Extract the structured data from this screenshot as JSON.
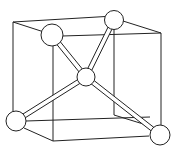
{
  "diagram": {
    "title": "",
    "colors": {
      "line": "#222222",
      "fill": "#ffffff",
      "background": "#ffffff"
    },
    "cube_edges": [
      {
        "x1": 13,
        "y1": 22,
        "x2": 114,
        "y2": 16
      },
      {
        "x1": 13,
        "y1": 22,
        "x2": 44,
        "y2": 32
      },
      {
        "x1": 123,
        "y1": 21,
        "x2": 161,
        "y2": 33
      },
      {
        "x1": 62,
        "y1": 36,
        "x2": 161,
        "y2": 33
      },
      {
        "x1": 13,
        "y1": 22,
        "x2": 13,
        "y2": 113
      },
      {
        "x1": 53,
        "y1": 46,
        "x2": 53,
        "y2": 141
      },
      {
        "x1": 161,
        "y1": 33,
        "x2": 161,
        "y2": 125
      },
      {
        "x1": 114,
        "y1": 29,
        "x2": 114,
        "y2": 115
      },
      {
        "x1": 26,
        "y1": 121,
        "x2": 150,
        "y2": 117
      },
      {
        "x1": 24,
        "y1": 128,
        "x2": 53,
        "y2": 141
      },
      {
        "x1": 53,
        "y1": 141,
        "x2": 149,
        "y2": 136
      },
      {
        "x1": 114,
        "y1": 115,
        "x2": 153,
        "y2": 127
      }
    ],
    "bonds": [
      {
        "from": "center",
        "to": "top-left"
      },
      {
        "from": "center",
        "to": "top-right"
      },
      {
        "from": "center",
        "to": "bottom-left"
      },
      {
        "from": "center",
        "to": "bottom-right"
      }
    ],
    "atoms": [
      {
        "id": "top-left",
        "cx": 52,
        "cy": 35,
        "r": 11
      },
      {
        "id": "top-right",
        "cx": 114,
        "cy": 20,
        "r": 9.5
      },
      {
        "id": "center",
        "cx": 86,
        "cy": 77,
        "r": 9
      },
      {
        "id": "bottom-left",
        "cx": 16,
        "cy": 121,
        "r": 10
      },
      {
        "id": "bottom-right",
        "cx": 160,
        "cy": 135,
        "r": 10
      }
    ]
  }
}
